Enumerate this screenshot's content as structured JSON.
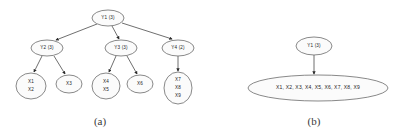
{
  "figure": {
    "background_color": "#ffffff",
    "node_fill_color": "#fbfbfb",
    "node_stroke_color": "#6b6b6b",
    "edge_color": "#4a4a4a",
    "text_color": "#1d1d1d",
    "panels": [
      {
        "id": "panel-a",
        "caption": "(a)",
        "description": "hierarchical tree of Y nodes over X leaf nodes",
        "nodes": [
          {
            "id": "a-y1",
            "label": "Y1 (3)",
            "lines": [
              "Y1 (3)"
            ],
            "cx": 108,
            "cy": 18,
            "rx": 16,
            "ry": 8,
            "level": 0
          },
          {
            "id": "a-y2",
            "label": "Y2 (3)",
            "lines": [
              "Y2 (3)"
            ],
            "cx": 47,
            "cy": 48,
            "rx": 16,
            "ry": 8,
            "level": 1
          },
          {
            "id": "a-y3",
            "label": "Y3 (3)",
            "lines": [
              "Y3 (3)"
            ],
            "cx": 121,
            "cy": 48,
            "rx": 16,
            "ry": 8,
            "level": 1
          },
          {
            "id": "a-y4",
            "label": "Y4 (2)",
            "lines": [
              "Y4 (2)"
            ],
            "cx": 178,
            "cy": 48,
            "rx": 16,
            "ry": 8,
            "level": 1
          },
          {
            "id": "a-x12",
            "label": "X1 X2",
            "lines": [
              "X1",
              "X2"
            ],
            "cx": 31,
            "cy": 86,
            "rx": 15,
            "ry": 13,
            "level": 2
          },
          {
            "id": "a-x3",
            "label": "X3",
            "lines": [
              "X3"
            ],
            "cx": 69,
            "cy": 84,
            "rx": 13,
            "ry": 9,
            "level": 2
          },
          {
            "id": "a-x45",
            "label": "X4 X5",
            "lines": [
              "X4",
              "X5"
            ],
            "cx": 106,
            "cy": 86,
            "rx": 14,
            "ry": 13,
            "level": 2
          },
          {
            "id": "a-x6",
            "label": "X6",
            "lines": [
              "X6"
            ],
            "cx": 140,
            "cy": 84,
            "rx": 13,
            "ry": 9,
            "level": 2
          },
          {
            "id": "a-x789",
            "label": "X7 X8 X9",
            "lines": [
              "X7",
              "X8",
              "X9"
            ],
            "cx": 178,
            "cy": 88,
            "rx": 14,
            "ry": 16,
            "level": 2
          }
        ],
        "edges": [
          {
            "id": "a-e1",
            "from": "a-y1",
            "to": "a-y2",
            "x1": 97,
            "y1": 24,
            "x2": 56,
            "y2": 40
          },
          {
            "id": "a-e2",
            "from": "a-y1",
            "to": "a-y3",
            "x1": 112,
            "y1": 26,
            "x2": 119,
            "y2": 39
          },
          {
            "id": "a-e3",
            "from": "a-y1",
            "to": "a-y4",
            "x1": 122,
            "y1": 23,
            "x2": 172,
            "y2": 39
          },
          {
            "id": "a-e4",
            "from": "a-y2",
            "to": "a-x12",
            "x1": 42,
            "y1": 56,
            "x2": 34,
            "y2": 72
          },
          {
            "id": "a-e5",
            "from": "a-y2",
            "to": "a-x3",
            "x1": 54,
            "y1": 56,
            "x2": 65,
            "y2": 74
          },
          {
            "id": "a-e6",
            "from": "a-y3",
            "to": "a-x45",
            "x1": 116,
            "y1": 56,
            "x2": 109,
            "y2": 72
          },
          {
            "id": "a-e7",
            "from": "a-y3",
            "to": "a-x6",
            "x1": 127,
            "y1": 56,
            "x2": 137,
            "y2": 74
          },
          {
            "id": "a-e8",
            "from": "a-y4",
            "to": "a-x789",
            "x1": 178,
            "y1": 56,
            "x2": 178,
            "y2": 71
          }
        ],
        "caption_x": 100,
        "caption_y": 122
      },
      {
        "id": "panel-b",
        "caption": "(b)",
        "description": "single Y node pointing to one flat node containing all X variables",
        "nodes": [
          {
            "id": "b-y1",
            "label": "Y1 (3)",
            "lines": [
              "Y1 (3)"
            ],
            "cx": 314,
            "cy": 46,
            "rx": 18,
            "ry": 9,
            "level": 0
          },
          {
            "id": "b-all",
            "label": "X1, X2, X3, X4, X5, X6, X7, X8, X9",
            "lines": [
              "X1, X2, X3, X4, X5, X6, X7, X8, X9"
            ],
            "cx": 318,
            "cy": 88,
            "rx": 70,
            "ry": 13,
            "level": 1
          }
        ],
        "edges": [
          {
            "id": "b-e1",
            "from": "b-y1",
            "to": "b-all",
            "x1": 314,
            "y1": 55,
            "x2": 314,
            "y2": 74
          }
        ],
        "caption_x": 314,
        "caption_y": 122
      }
    ]
  }
}
